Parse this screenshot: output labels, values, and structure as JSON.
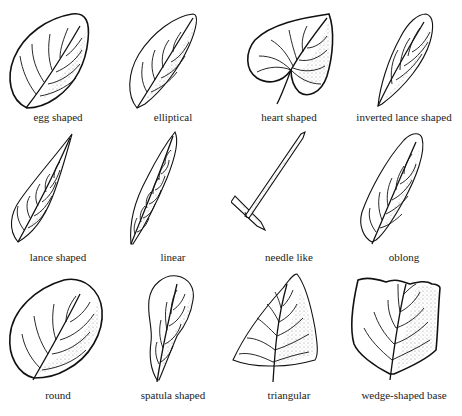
{
  "diagram": {
    "leaves": [
      {
        "id": "egg",
        "label": "egg shaped"
      },
      {
        "id": "elliptical",
        "label": "elliptical"
      },
      {
        "id": "heart",
        "label": "heart shaped"
      },
      {
        "id": "inverted-lance",
        "label": "inverted lance shaped"
      },
      {
        "id": "lance",
        "label": "lance shaped"
      },
      {
        "id": "linear",
        "label": "linear"
      },
      {
        "id": "needle",
        "label": "needle like"
      },
      {
        "id": "oblong",
        "label": "oblong"
      },
      {
        "id": "round",
        "label": "round"
      },
      {
        "id": "spatula",
        "label": "spatula shaped"
      },
      {
        "id": "triangular",
        "label": "triangular"
      },
      {
        "id": "wedge",
        "label": "wedge-shaped base"
      }
    ]
  }
}
